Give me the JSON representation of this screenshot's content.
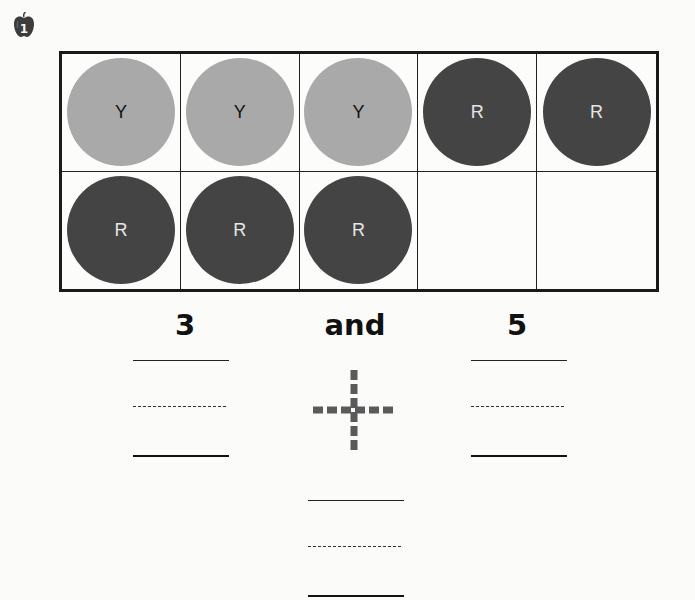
{
  "problem": {
    "number": "1",
    "icon": "apple-icon"
  },
  "ten_frame": {
    "rows": 2,
    "columns": 5,
    "cells": [
      {
        "counter": "yellow",
        "letter": "Y"
      },
      {
        "counter": "yellow",
        "letter": "Y"
      },
      {
        "counter": "yellow",
        "letter": "Y"
      },
      {
        "counter": "red",
        "letter": "R"
      },
      {
        "counter": "red",
        "letter": "R"
      },
      {
        "counter": "red",
        "letter": "R"
      },
      {
        "counter": "red",
        "letter": "R"
      },
      {
        "counter": "red",
        "letter": "R"
      },
      {
        "counter": null,
        "letter": ""
      },
      {
        "counter": null,
        "letter": ""
      }
    ],
    "colors": {
      "yellow_counter": "#a9a9a9",
      "red_counter": "#444444",
      "frame_border": "#1a1a1a"
    }
  },
  "sentence": {
    "left_number": "3",
    "connector": "and",
    "right_number": "5"
  },
  "answer_boxes": {
    "left": {
      "value": ""
    },
    "operator": {
      "symbol": "plus-icon",
      "style": "dashed-trace"
    },
    "right": {
      "value": ""
    },
    "total": {
      "value": ""
    }
  }
}
